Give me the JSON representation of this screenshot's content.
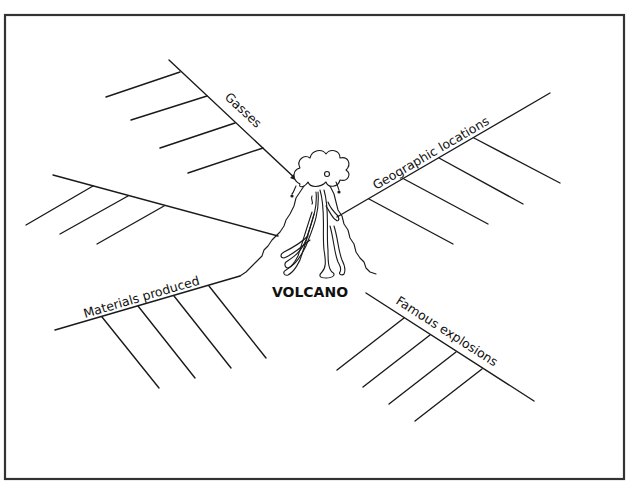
{
  "diagram": {
    "type": "fishbone",
    "center_label": "VOLCANO",
    "center_icon": "volcano-illustration",
    "colors": {
      "line": "#1a1a1a",
      "frame": "#333333",
      "background": "#ffffff"
    },
    "branches": [
      {
        "id": "gasses",
        "label": "Gasses",
        "ribs": 4
      },
      {
        "id": "unlabeled-left",
        "label": "",
        "ribs": 3
      },
      {
        "id": "materials",
        "label": "Materials produced",
        "ribs": 4
      },
      {
        "id": "geographic",
        "label": "Geographic locations",
        "ribs": 4
      },
      {
        "id": "famous",
        "label": "Famous explosions",
        "ribs": 4
      }
    ]
  }
}
